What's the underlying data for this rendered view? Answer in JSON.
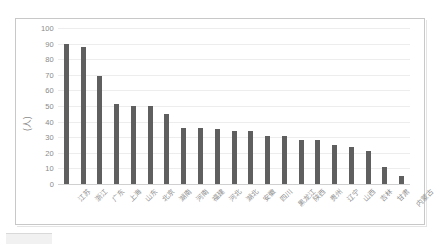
{
  "chart_data": {
    "type": "bar",
    "title": "",
    "subtitle": "",
    "xlabel": "",
    "ylabel": "(人)",
    "ylim": [
      0,
      100
    ],
    "ytick_step": 10,
    "yticks": [
      "100",
      "90",
      "80",
      "70",
      "60",
      "50",
      "40",
      "30",
      "20",
      "10",
      "0"
    ],
    "grid": true,
    "legend": false,
    "legend_position": "none",
    "orientation": "vertical",
    "bar_color": "#5f5f5f",
    "gridline_color": "#ededed",
    "axis_text_color": "#8a8a8a",
    "categories": [
      "江苏",
      "浙江",
      "广东",
      "上海",
      "山东",
      "北京",
      "湖南",
      "河南",
      "福建",
      "河北",
      "湖北",
      "安徽",
      "四川",
      "黑龙江",
      "陕西",
      "贵州",
      "辽宁",
      "山西",
      "吉林",
      "甘肃",
      "内蒙古"
    ],
    "values": [
      90,
      88,
      69,
      51,
      50,
      50,
      45,
      36,
      36,
      35,
      34,
      34,
      31,
      31,
      28,
      28,
      25,
      24,
      21,
      11,
      5
    ],
    "series": [
      {
        "name": "人数",
        "values": [
          90,
          88,
          69,
          51,
          50,
          50,
          45,
          36,
          36,
          35,
          34,
          34,
          31,
          31,
          28,
          28,
          25,
          24,
          21,
          11,
          5
        ]
      }
    ]
  }
}
